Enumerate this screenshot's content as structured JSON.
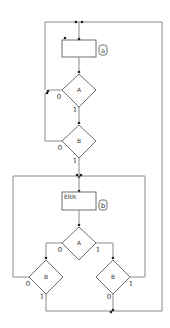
{
  "diagram": {
    "type": "flowchart",
    "colors": {
      "line": "#8a8a8a",
      "shape": "#6f6f6f",
      "text": "#333333",
      "background": "#ffffff"
    },
    "loop1": {
      "process": {
        "text": "",
        "tag": "a"
      },
      "decision_a": {
        "text": "A",
        "false_label": "0",
        "true_label": "1"
      },
      "decision_b": {
        "text": "B",
        "false_label": "0",
        "true_label": "1"
      }
    },
    "loop2": {
      "process": {
        "text": "ERR",
        "tag": "b"
      },
      "decision_a": {
        "text": "A",
        "false_label": "0",
        "true_label": "1"
      },
      "decision_b_left": {
        "text": "B",
        "false_label": "0",
        "true_label": "1"
      },
      "decision_b_right": {
        "text": "B",
        "false_label": "0",
        "true_label": "1"
      }
    }
  }
}
